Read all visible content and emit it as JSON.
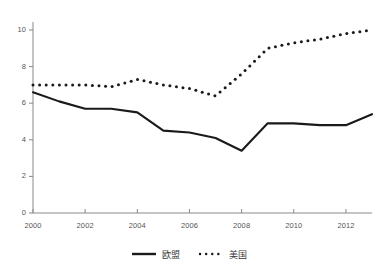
{
  "chart_data": {
    "type": "line",
    "title": "",
    "subtitle": "",
    "xlabel": "",
    "ylabel": "",
    "xlim": [
      2000,
      2013
    ],
    "ylim": [
      0,
      10.8
    ],
    "grid": false,
    "legend_position": "bottom-center",
    "x": [
      2000,
      2001,
      2002,
      2003,
      2004,
      2005,
      2006,
      2007,
      2008,
      2009,
      2010,
      2011,
      2012,
      2013
    ],
    "xticks": [
      2000,
      2002,
      2004,
      2006,
      2008,
      2010,
      2012
    ],
    "xticklabels": [
      "2000",
      "2002",
      "2004",
      "2006",
      "2008",
      "2010",
      "2012"
    ],
    "yticks": [
      0,
      2,
      4,
      6,
      8,
      10
    ],
    "yticklabels": [
      "0",
      "2",
      "4",
      "6",
      "8",
      "10"
    ],
    "series": [
      {
        "name": "欧盟",
        "style": "solid",
        "color": "#1a1a1a",
        "values": [
          6.6,
          6.1,
          5.7,
          5.7,
          5.5,
          4.5,
          4.4,
          4.1,
          3.4,
          4.9,
          4.9,
          4.8,
          4.8,
          5.4
        ]
      },
      {
        "name": "美国",
        "style": "dotted",
        "color": "#1a1a1a",
        "values": [
          7.0,
          7.0,
          7.0,
          6.9,
          7.3,
          7.0,
          6.8,
          6.4,
          7.6,
          9.0,
          9.3,
          9.5,
          9.8,
          10.0
        ]
      }
    ]
  },
  "axes": {
    "y_tick_labels": [
      "10",
      "8",
      "6",
      "4",
      "2",
      "0"
    ],
    "x_tick_labels": [
      "2000",
      "2002",
      "2004",
      "2006",
      "2008",
      "2010",
      "2012"
    ]
  },
  "legend": {
    "items": [
      {
        "label": "欧盟",
        "style": "solid"
      },
      {
        "label": "美国",
        "style": "dotted"
      }
    ]
  },
  "colors": {
    "series_line": "#1a1a1a",
    "axis": "#888888",
    "tick_text": "#555555",
    "background": "#ffffff"
  }
}
